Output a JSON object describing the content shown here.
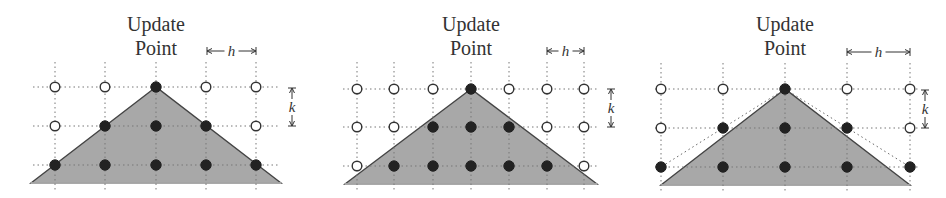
{
  "figure": {
    "panels": [
      {
        "id": "panel-1",
        "title_line1": "Update",
        "title_line2": "Point",
        "h_label": "h",
        "k_label": "k",
        "columns_x": [
          55,
          105,
          156,
          206,
          256
        ],
        "rows_y": [
          87,
          126,
          165
        ],
        "grid_extent": {
          "x0": 33,
          "x1": 279,
          "y0": 62,
          "y1": 190
        },
        "triangle": {
          "apex": [
            156,
            87
          ],
          "left": [
            31,
            183
          ],
          "right": [
            281,
            183
          ]
        },
        "domain_lines": false,
        "h_arrow": {
          "x0": 207,
          "x1": 256,
          "y": 51
        },
        "k_arrow": {
          "x": 292,
          "y0": 88,
          "y1": 126
        },
        "points": [
          [
            "open",
            "open",
            "solid",
            "open",
            "open"
          ],
          [
            "open",
            "solid",
            "solid",
            "solid",
            "open"
          ],
          [
            "solid",
            "solid",
            "solid",
            "solid",
            "solid"
          ]
        ]
      },
      {
        "id": "panel-2",
        "title_line1": "Update",
        "title_line2": "Point",
        "h_label": "h",
        "k_label": "k",
        "columns_x": [
          357,
          394,
          433,
          471,
          509,
          547,
          584
        ],
        "rows_y": [
          89,
          127,
          166
        ],
        "grid_extent": {
          "x0": 343,
          "x1": 598,
          "y0": 62,
          "y1": 190
        },
        "triangle": {
          "apex": [
            471,
            89
          ],
          "left": [
            345,
            184
          ],
          "right": [
            597,
            184
          ]
        },
        "domain_lines": false,
        "h_arrow": {
          "x0": 547,
          "x1": 584,
          "y": 51
        },
        "k_arrow": {
          "x": 611,
          "y0": 89,
          "y1": 127
        },
        "points": [
          [
            "open",
            "open",
            "open",
            "solid",
            "open",
            "open",
            "open"
          ],
          [
            "open",
            "open",
            "solid",
            "solid",
            "solid",
            "open",
            "open"
          ],
          [
            "open",
            "solid",
            "solid",
            "solid",
            "solid",
            "solid",
            "open"
          ]
        ]
      },
      {
        "id": "panel-3",
        "title_line1": "Update",
        "title_line2": "Point",
        "h_label": "h",
        "k_label": "k",
        "columns_x": [
          661,
          723,
          785,
          847,
          910
        ],
        "rows_y": [
          89,
          128,
          167
        ],
        "grid_extent": {
          "x0": 655,
          "x1": 918,
          "y0": 63,
          "y1": 191
        },
        "triangle": {
          "apex": [
            785,
            89
          ],
          "left": [
            661,
            185
          ],
          "right": [
            910,
            185
          ]
        },
        "domain_lines": true,
        "h_arrow": {
          "x0": 847,
          "x1": 910,
          "y": 52
        },
        "k_arrow": {
          "x": 925,
          "y0": 90,
          "y1": 128
        },
        "points": [
          [
            "open",
            "open",
            "solid",
            "open",
            "open"
          ],
          [
            "open",
            "solid",
            "solid",
            "solid",
            "open"
          ],
          [
            "solid",
            "solid",
            "solid",
            "solid",
            "solid"
          ]
        ]
      }
    ]
  }
}
